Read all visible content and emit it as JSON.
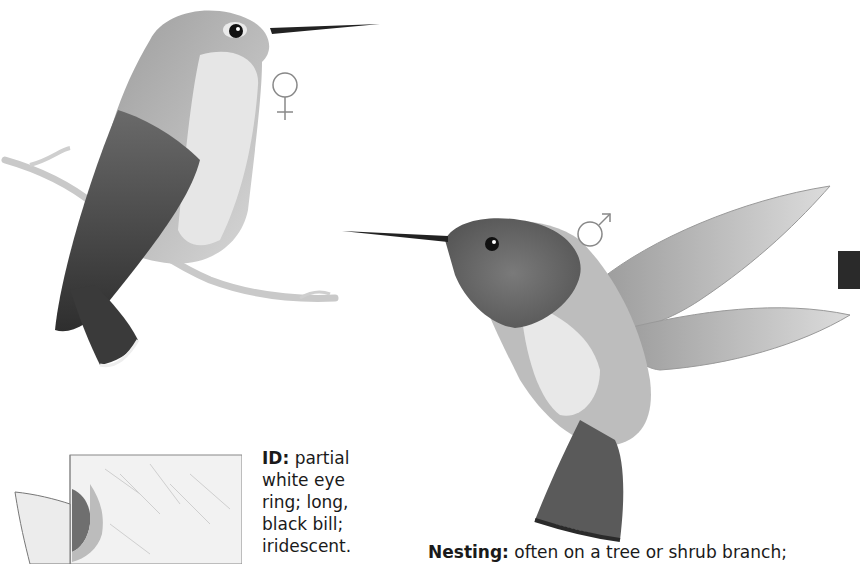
{
  "illustrations": {
    "female": {
      "label": "female hummingbird perched on branch",
      "symbol": "♀"
    },
    "male": {
      "label": "male hummingbird in flight",
      "symbol": "♂"
    }
  },
  "range_map": {
    "label": "range map of Washington"
  },
  "id_section": {
    "label": "ID:",
    "lines": [
      "partial",
      "white eye",
      "ring; long,",
      "black bill;",
      "iridescent."
    ]
  },
  "nesting_section": {
    "label": "Nesting:",
    "text": "often on a tree or shrub branch;"
  },
  "colors": {
    "thumb_tab": "#2a2a2a",
    "range_shade": "#6f6f6f"
  }
}
